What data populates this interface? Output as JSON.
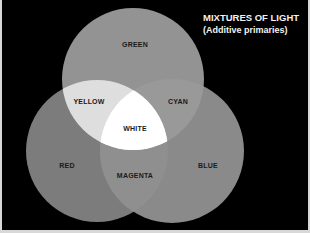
{
  "title": {
    "line1": "MIXTURES OF LIGHT",
    "line2": "(Additive primaries)"
  },
  "circles": {
    "green": {
      "label": "GREEN",
      "fill": "#939393"
    },
    "red": {
      "label": "RED",
      "fill": "#7c7c7c"
    },
    "blue": {
      "label": "BLUE",
      "fill": "#8a8a8a"
    }
  },
  "overlaps": {
    "yellow": {
      "label": "YELLOW",
      "fill": "#dedede"
    },
    "cyan": {
      "label": "CYAN",
      "fill": "#999999"
    },
    "magenta": {
      "label": "MAGENTA",
      "fill": "#8f8f8f"
    },
    "white": {
      "label": "WHITE",
      "fill": "#ffffff"
    }
  },
  "colors": {
    "background": "#000000",
    "border": "#d8d8d8",
    "label_text": "#1a1a1a",
    "title_text": "#f2f2f2"
  }
}
